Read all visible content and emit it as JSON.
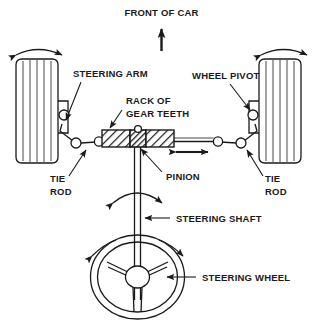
{
  "diagram": {
    "orientation_label": "FRONT OF CAR",
    "labels": {
      "front_of_car": "FRONT OF CAR",
      "steering_arm": "STEERING ARM",
      "wheel_pivot": "WHEEL PIVOT",
      "rack_of_gear_teeth_line1": "RACK OF",
      "rack_of_gear_teeth_line2": "GEAR TEETH",
      "pinion": "PINION",
      "tie_rod_left_line1": "TIE",
      "tie_rod_left_line2": "ROD",
      "tie_rod_right_line1": "TIE",
      "tie_rod_right_line2": "ROD",
      "steering_shaft": "STEERING SHAFT",
      "steering_wheel": "STEERING WHEEL"
    },
    "colors": {
      "ink": "#1a1a1a",
      "background": "#ffffff",
      "hatch": "#1a1a1a"
    },
    "parts": [
      "left-tire",
      "right-tire",
      "left-wheel-pivot",
      "right-wheel-pivot",
      "left-steering-arm",
      "right-steering-arm",
      "left-tie-rod",
      "right-tie-rod",
      "rack",
      "pinion",
      "steering-shaft",
      "steering-wheel"
    ],
    "motion_indicators": [
      "left-wheel-steer-arc",
      "right-wheel-steer-arc",
      "rack-translation-double-arrow",
      "shaft-rotation-arc",
      "steering-wheel-rotation-arc",
      "front-direction-arrow"
    ]
  }
}
